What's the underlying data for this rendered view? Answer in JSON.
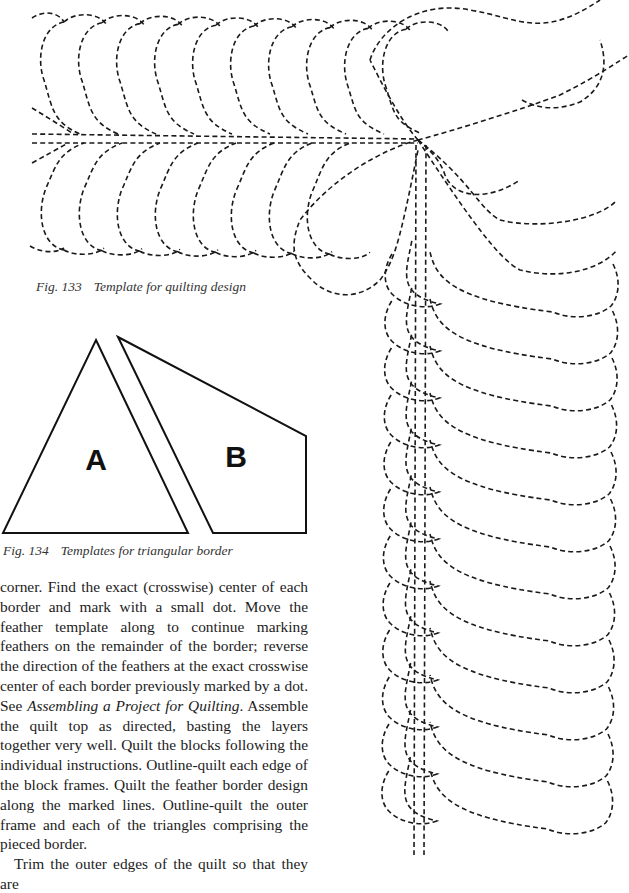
{
  "page": {
    "background": "#ffffff",
    "ink_color": "#1a1a1a"
  },
  "figures": {
    "fig133": {
      "number": "Fig. 133",
      "caption": "Template for quilting design",
      "subject": "feather-border-quilting-template",
      "horizontal_border": {
        "spine_y": [
          134,
          143
        ],
        "spine_x_start": 32,
        "corner_point": [
          418,
          140
        ],
        "feather_count_per_side": 10,
        "feather_spacing": 38,
        "top_scallop_y": 18,
        "bottom_scallop_y": 250
      },
      "vertical_border": {
        "spine_x": [
          416,
          426
        ],
        "left_outer_x": 388,
        "right_outer_x": 617,
        "feather_spacing": 47,
        "first_feather_y": 300
      },
      "corner_lobes": 3
    },
    "fig134": {
      "number": "Fig. 134",
      "caption": "Templates for triangular border",
      "templates": [
        {
          "label": "A",
          "shape": "triangle",
          "points": [
            [
              96,
              340
            ],
            [
              188,
              533
            ],
            [
              3,
              533
            ]
          ]
        },
        {
          "label": "B",
          "shape": "quadrilateral",
          "points": [
            [
              118,
              337
            ],
            [
              306,
              436
            ],
            [
              306,
              533
            ],
            [
              213,
              533
            ]
          ]
        }
      ]
    }
  },
  "body": {
    "paragraphs": [
      {
        "indent": false,
        "segments": [
          {
            "text": "corner. Find the exact (crosswise) center of each border and mark with a small dot. Move the feather template along to continue marking feathers on the remainder of the border; reverse the direction of the feathers at the exact crosswise center of each border previously marked by a dot. See ",
            "italic": false
          },
          {
            "text": "Assembling a Project for Quilting",
            "italic": true
          },
          {
            "text": ". Assemble the quilt top as directed, basting the layers together very well. Quilt the blocks following the individual instructions. Outline-quilt each edge of the block frames. Quilt the feather border design along the marked lines. Outline-quilt the outer frame and each of the triangles comprising the pieced border.",
            "italic": false
          }
        ]
      },
      {
        "indent": true,
        "segments": [
          {
            "text": "Trim the outer edges of the quilt so that they are",
            "italic": false
          }
        ]
      }
    ]
  }
}
